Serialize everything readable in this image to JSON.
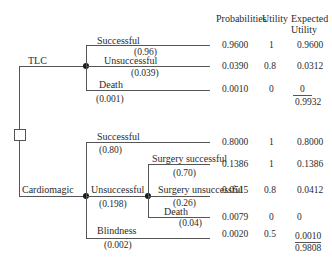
{
  "headers": {
    "probabilities": "Probabilities",
    "utility": "Utility",
    "expected_line1": "Expected",
    "expected_line2": "Utility"
  },
  "decision_node": {
    "icon": "square-decision-node"
  },
  "options": [
    {
      "label": "TLC",
      "branches": [
        {
          "label": "Successful",
          "prob": "(0.96)",
          "probability": "0.9600",
          "utility": "1",
          "expected": "0.9600"
        },
        {
          "label": "Unsuccessful",
          "prob": "(0.039)",
          "probability": "0.0390",
          "utility": "0.8",
          "expected": "0.0312"
        },
        {
          "label": "Death",
          "prob": "(0.001)",
          "probability": "0.0010",
          "utility": "0",
          "expected": "0"
        }
      ],
      "total": "0.9932"
    },
    {
      "label": "Cardiomagic",
      "branches": [
        {
          "label": "Successful",
          "prob": "(0.80)",
          "probability": "0.8000",
          "utility": "1",
          "expected": "0.8000"
        },
        {
          "label": "Unsuccessful",
          "prob": "(0.198)",
          "sub_branches": [
            {
              "label": "Surgery successful",
              "prob": "(0.70)",
              "probability": "0.1386",
              "utility": "1",
              "expected": "0.1386"
            },
            {
              "label": "Surgery unsuccessful",
              "prob": "(0.26)",
              "probability": "0.0515",
              "utility": "0.8",
              "expected": "0.0412"
            },
            {
              "label": "Death",
              "prob": "(0.04)",
              "probability": "0.0079",
              "utility": "0",
              "expected": "0"
            }
          ]
        },
        {
          "label": "Blindness",
          "prob": "(0.002)",
          "probability": "0.0020",
          "utility": "0.5",
          "expected": "0.0010"
        }
      ],
      "total": "0.9808"
    }
  ]
}
